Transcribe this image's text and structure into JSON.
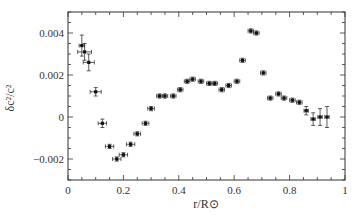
{
  "chart_data": {
    "type": "scatter",
    "title": "",
    "xlabel": "r/R⊙",
    "ylabel": "δc²/c²",
    "xlim": [
      0,
      1
    ],
    "ylim": [
      -0.003,
      0.005
    ],
    "grid": false,
    "legend": null,
    "xticks": [
      0,
      0.2,
      0.4,
      0.6,
      0.8,
      1
    ],
    "xtick_labels": [
      "0",
      "0.2",
      "0.4",
      "0.6",
      "0.8",
      "1"
    ],
    "yticks": [
      -0.002,
      0,
      0.002,
      0.004
    ],
    "ytick_labels": [
      "−0.002",
      "0",
      "0.002",
      "0.004"
    ],
    "series": [
      {
        "name": "data",
        "marker": "square",
        "x": [
          0.05,
          0.06,
          0.075,
          0.1,
          0.124,
          0.15,
          0.176,
          0.2,
          0.226,
          0.25,
          0.28,
          0.3,
          0.33,
          0.35,
          0.38,
          0.405,
          0.43,
          0.45,
          0.48,
          0.51,
          0.53,
          0.555,
          0.58,
          0.61,
          0.63,
          0.66,
          0.68,
          0.705,
          0.73,
          0.76,
          0.78,
          0.81,
          0.835,
          0.86,
          0.885,
          0.91,
          0.935
        ],
        "y": [
          0.0034,
          0.0031,
          0.0026,
          0.0012,
          -0.0003,
          -0.0014,
          -0.002,
          -0.0018,
          -0.0013,
          -0.0008,
          -0.0003,
          0.0004,
          0.001,
          0.001,
          0.001,
          0.0013,
          0.0017,
          0.0018,
          0.0017,
          0.0016,
          0.0016,
          0.0013,
          0.0015,
          0.0017,
          0.0027,
          0.0041,
          0.004,
          0.0021,
          0.0009,
          0.0011,
          0.0009,
          0.0008,
          0.0007,
          0.0003,
          -0.0001,
          0.0,
          0.0
        ],
        "xerr": [
          0.01,
          0.025,
          0.02,
          0.02,
          0.015,
          0.015,
          0.015,
          0.015,
          0.015,
          0.012,
          0.012,
          0.012,
          0.01,
          0.01,
          0.01,
          0.01,
          0.01,
          0.01,
          0.01,
          0.01,
          0.01,
          0.01,
          0.01,
          0.01,
          0.01,
          0.01,
          0.01,
          0.01,
          0.01,
          0.01,
          0.01,
          0.01,
          0.01,
          0.008,
          0.008,
          0.008,
          0.008
        ],
        "yerr": [
          0.0005,
          0.0004,
          0.0004,
          0.0002,
          0.0002,
          0.0001,
          0.0001,
          0.0001,
          0.0001,
          0.0001,
          0.0001,
          0.0001,
          0.0001,
          0.0001,
          0.0001,
          0.0001,
          0.0001,
          0.0001,
          0.0001,
          0.0001,
          0.0001,
          0.0001,
          0.0001,
          0.0001,
          0.0001,
          0.0001,
          0.0001,
          0.0001,
          0.0001,
          0.0001,
          0.0001,
          0.0001,
          0.0001,
          0.0002,
          0.0003,
          0.0004,
          0.0005
        ]
      }
    ]
  }
}
